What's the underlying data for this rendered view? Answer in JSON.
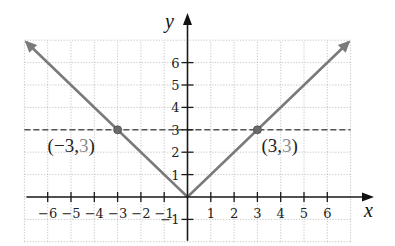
{
  "chart_data": {
    "type": "line",
    "title": "",
    "xlabel": "x",
    "ylabel": "y",
    "xlim": [
      -7,
      7
    ],
    "ylim": [
      -2,
      7
    ],
    "grid": true,
    "x_ticks": [
      -6,
      -5,
      -4,
      -3,
      -2,
      -1,
      1,
      2,
      3,
      4,
      5,
      6
    ],
    "x_tick_labels": [
      "−6",
      "−5",
      "−4",
      "−3",
      "−2",
      "−1",
      "1",
      "2",
      "3",
      "4",
      "5",
      "6"
    ],
    "y_ticks": [
      -1,
      1,
      2,
      3,
      4,
      5,
      6
    ],
    "y_tick_labels": [
      "−1",
      "1",
      "2",
      "3",
      "4",
      "5",
      "6"
    ],
    "series": [
      {
        "name": "y = |x|",
        "style": "solid",
        "color": "#7a7a7a",
        "arrows": "both",
        "points": [
          [
            -6.9,
            6.9
          ],
          [
            0,
            0
          ],
          [
            6.9,
            6.9
          ]
        ]
      },
      {
        "name": "y = 3",
        "style": "dashed",
        "color": "#555555",
        "points": [
          [
            -7,
            3
          ],
          [
            7,
            3
          ]
        ]
      }
    ],
    "annotations": [
      {
        "point": [
          -3,
          3
        ],
        "label_open": "(−3,",
        "label_second": "3",
        "label_close": ")",
        "position": "below-left"
      },
      {
        "point": [
          3,
          3
        ],
        "label_open": "(3,",
        "label_second": "3",
        "label_close": ")",
        "position": "below-right"
      }
    ],
    "legend": null
  }
}
